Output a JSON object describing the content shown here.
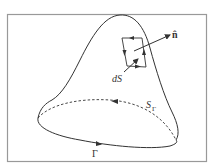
{
  "figure": {
    "frame_color": "#999999",
    "stroke_color": "#333333"
  },
  "labels": {
    "normal": "n̂",
    "surface_element": "dS",
    "surface_name": "S",
    "surface_subscript": "Γ",
    "boundary": "Γ"
  }
}
